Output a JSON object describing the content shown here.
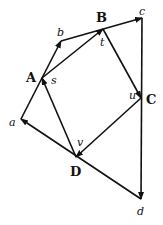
{
  "diagram": {
    "type": "vector-polygon",
    "stroke_color": "#111111",
    "background": "#ffffff",
    "nodes": {
      "A": {
        "label": "A",
        "x": 42,
        "y": 78,
        "bold": true,
        "lx": 26,
        "ly": 82
      },
      "B": {
        "label": "B",
        "x": 103,
        "y": 29,
        "bold": true,
        "lx": 96,
        "ly": 22
      },
      "C": {
        "label": "C",
        "x": 141,
        "y": 98,
        "bold": true,
        "lx": 146,
        "ly": 104
      },
      "D": {
        "label": "D",
        "x": 76,
        "y": 157,
        "bold": true,
        "lx": 70,
        "ly": 176
      },
      "a": {
        "label": "a",
        "x": 21,
        "y": 119,
        "lx": 9,
        "ly": 126
      },
      "b": {
        "label": "b",
        "x": 61,
        "y": 41,
        "lx": 57,
        "ly": 36
      },
      "c": {
        "label": "c",
        "x": 142,
        "y": 18,
        "lx": 139,
        "ly": 15
      },
      "d": {
        "label": "d",
        "x": 141,
        "y": 199,
        "lx": 137,
        "ly": 215
      }
    },
    "midpoint_labels": [
      {
        "label": "s",
        "x": 51,
        "y": 84
      },
      {
        "label": "t",
        "x": 100,
        "y": 46
      },
      {
        "label": "u",
        "x": 129,
        "y": 99
      },
      {
        "label": "v",
        "x": 77,
        "y": 146
      }
    ],
    "edges": [
      {
        "from": "a",
        "to": "A",
        "arrow": false
      },
      {
        "from": "A",
        "to": "b",
        "arrow": true
      },
      {
        "from": "b",
        "to": "c",
        "arrow": true
      },
      {
        "from": "c",
        "to": "d",
        "arrow": true
      },
      {
        "from": "d",
        "to": "a",
        "arrow": true
      },
      {
        "from": "A",
        "to": "B",
        "arrow": true
      },
      {
        "from": "B",
        "to": "C",
        "arrow": true
      },
      {
        "from": "C",
        "to": "D",
        "arrow": true
      },
      {
        "from": "D",
        "to": "A",
        "arrow": true
      }
    ]
  }
}
